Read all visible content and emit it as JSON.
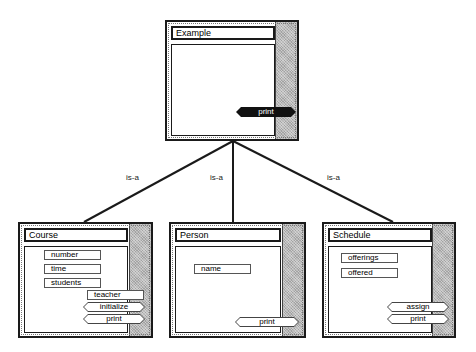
{
  "diagram": {
    "type": "class-inheritance",
    "relation_label": "is-a",
    "parent": {
      "name": "Example",
      "attributes": [],
      "methods": [
        {
          "label": "print",
          "highlighted": true
        }
      ]
    },
    "children": [
      {
        "name": "Course",
        "attributes": [
          "number",
          "time",
          "students",
          "teacher"
        ],
        "methods": [
          {
            "label": "initialize"
          },
          {
            "label": "print"
          }
        ]
      },
      {
        "name": "Person",
        "attributes": [
          "name"
        ],
        "methods": [
          {
            "label": "print"
          }
        ]
      },
      {
        "name": "Schedule",
        "attributes": [
          "offerings",
          "offered"
        ],
        "methods": [
          {
            "label": "assign"
          },
          {
            "label": "print"
          }
        ]
      }
    ],
    "edges": [
      {
        "from": "Example",
        "to": "Course",
        "label": "is-a"
      },
      {
        "from": "Example",
        "to": "Person",
        "label": "is-a"
      },
      {
        "from": "Example",
        "to": "Schedule",
        "label": "is-a"
      }
    ]
  },
  "colors": {
    "border": "#1a1a1a",
    "shade": "#b8b8b8",
    "highlight_method_bg": "#111111",
    "background": "#ffffff"
  }
}
